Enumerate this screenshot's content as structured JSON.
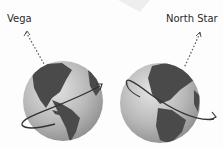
{
  "diagram": {
    "left": {
      "star_label": "Vega",
      "description": "Earth with axis tilted toward Vega"
    },
    "right": {
      "star_label": "North Star",
      "description": "Earth with axis tilted toward North Star"
    }
  },
  "colors": {
    "ocean": "#b9b9b9",
    "land": "#4a4a4a",
    "orbit_line": "#333333",
    "axis_dots": "#555555"
  }
}
